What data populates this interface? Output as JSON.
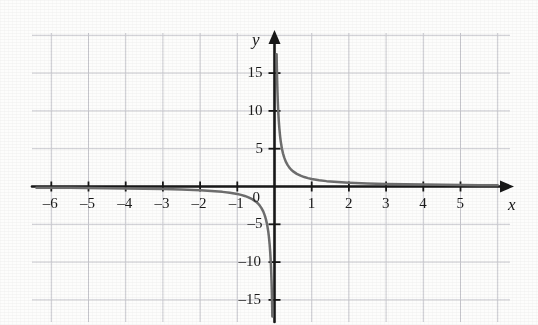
{
  "chart_data": {
    "type": "line",
    "title": "",
    "subtitle": "",
    "xlabel": "x",
    "ylabel": "y",
    "function": "y = 1/x",
    "xlim": [
      -6.6,
      6.1
    ],
    "ylim": [
      -16.5,
      20.5
    ],
    "grid": true,
    "grid_spacing_x": 1,
    "grid_spacing_y": 5,
    "legend": "none",
    "x_ticks": [
      -6,
      -5,
      -4,
      -3,
      -2,
      -1,
      1,
      2,
      3,
      4,
      5
    ],
    "x_tick_labels": [
      "–6",
      "–5",
      "–4",
      "–3",
      "–2",
      "–1",
      "1",
      "2",
      "3",
      "4",
      "5"
    ],
    "y_ticks": [
      15,
      10,
      5,
      -5,
      -10,
      -15
    ],
    "y_tick_labels": [
      "15",
      "10",
      "5",
      "–5",
      "–10",
      "–15"
    ],
    "origin_label": "0",
    "series": [
      {
        "name": "branch-positive",
        "comment": "right branch of y = 1/x, x > 0",
        "points": [
          [
            0.057,
            17.5
          ],
          [
            0.06,
            16.6
          ],
          [
            0.065,
            15.4
          ],
          [
            0.07,
            14.3
          ],
          [
            0.08,
            12.5
          ],
          [
            0.09,
            11.1
          ],
          [
            0.1,
            10.0
          ],
          [
            0.115,
            8.7
          ],
          [
            0.13,
            7.7
          ],
          [
            0.15,
            6.67
          ],
          [
            0.17,
            5.88
          ],
          [
            0.2,
            5.0
          ],
          [
            0.23,
            4.35
          ],
          [
            0.26,
            3.85
          ],
          [
            0.3,
            3.33
          ],
          [
            0.35,
            2.86
          ],
          [
            0.4,
            2.5
          ],
          [
            0.45,
            2.22
          ],
          [
            0.5,
            2.0
          ],
          [
            0.6,
            1.67
          ],
          [
            0.7,
            1.43
          ],
          [
            0.8,
            1.25
          ],
          [
            0.9,
            1.11
          ],
          [
            1.0,
            1.0
          ],
          [
            1.2,
            0.83
          ],
          [
            1.4,
            0.71
          ],
          [
            1.6,
            0.63
          ],
          [
            1.8,
            0.56
          ],
          [
            2.0,
            0.5
          ],
          [
            2.5,
            0.4
          ],
          [
            3.0,
            0.33
          ],
          [
            3.5,
            0.29
          ],
          [
            4.0,
            0.25
          ],
          [
            4.5,
            0.22
          ],
          [
            5.0,
            0.2
          ],
          [
            5.5,
            0.18
          ],
          [
            6.0,
            0.17
          ]
        ]
      },
      {
        "name": "branch-negative",
        "comment": "left branch of y = 1/x, x < 0",
        "points": [
          [
            -6.4,
            -0.156
          ],
          [
            -6.0,
            -0.167
          ],
          [
            -5.5,
            -0.18
          ],
          [
            -5.0,
            -0.2
          ],
          [
            -4.5,
            -0.22
          ],
          [
            -4.0,
            -0.25
          ],
          [
            -3.5,
            -0.29
          ],
          [
            -3.0,
            -0.33
          ],
          [
            -2.5,
            -0.4
          ],
          [
            -2.0,
            -0.5
          ],
          [
            -1.8,
            -0.56
          ],
          [
            -1.6,
            -0.63
          ],
          [
            -1.4,
            -0.71
          ],
          [
            -1.2,
            -0.83
          ],
          [
            -1.0,
            -1.0
          ],
          [
            -0.9,
            -1.11
          ],
          [
            -0.8,
            -1.25
          ],
          [
            -0.7,
            -1.43
          ],
          [
            -0.6,
            -1.67
          ],
          [
            -0.5,
            -2.0
          ],
          [
            -0.45,
            -2.22
          ],
          [
            -0.4,
            -2.5
          ],
          [
            -0.35,
            -2.86
          ],
          [
            -0.3,
            -3.33
          ],
          [
            -0.26,
            -3.85
          ],
          [
            -0.23,
            -4.35
          ],
          [
            -0.2,
            -5.0
          ],
          [
            -0.17,
            -5.88
          ],
          [
            -0.15,
            -6.67
          ],
          [
            -0.13,
            -7.7
          ],
          [
            -0.115,
            -8.7
          ],
          [
            -0.1,
            -10.0
          ],
          [
            -0.09,
            -11.1
          ],
          [
            -0.08,
            -12.5
          ],
          [
            -0.07,
            -14.3
          ],
          [
            -0.062,
            -16.1
          ],
          [
            -0.058,
            -17.2
          ]
        ]
      }
    ],
    "colors": {
      "curve": "#6e6e6e",
      "axis": "#171717",
      "grid": "#c9c9cf",
      "background": "#fdfdfc",
      "text": "#1b1b1b"
    }
  }
}
